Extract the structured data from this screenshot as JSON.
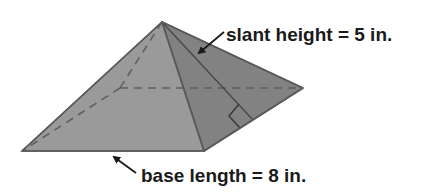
{
  "figure": {
    "type": "square pyramid",
    "labels": {
      "slant_height": "slant height = 5 in.",
      "base_length": "base length = 8 in."
    },
    "values": {
      "slant_height": 5,
      "base_length": 8,
      "unit": "in."
    },
    "colors": {
      "front_face": "#9a9a9a",
      "right_face": "#828282",
      "edge": "#5a5a5a",
      "dashed": "#5f5f5f",
      "text": "#1a1a1a"
    }
  }
}
